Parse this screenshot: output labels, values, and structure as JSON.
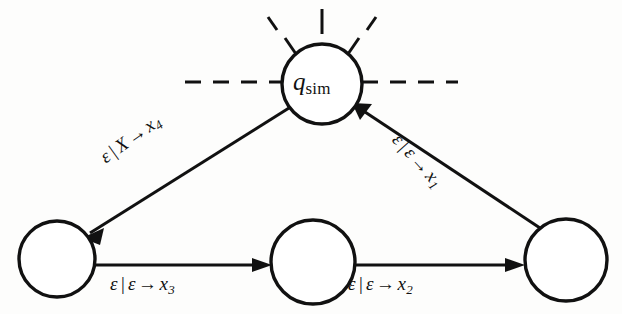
{
  "diagram": {
    "type": "finite-state-transducer",
    "title_text": "",
    "colors": {
      "stroke": "#111111",
      "node_fill": "#ffffff",
      "background": "#fdfdfc"
    },
    "nodes": [
      {
        "id": "q_sim",
        "label_main": "q",
        "label_sub": "sim",
        "cx": 322,
        "cy": 84,
        "r": 40,
        "has_rays": true,
        "has_dashes": true
      },
      {
        "id": "state-bottom-left",
        "label_main": "",
        "label_sub": "",
        "cx": 57,
        "cy": 259,
        "r": 38,
        "has_rays": false,
        "has_dashes": false
      },
      {
        "id": "state-bottom-middle",
        "label_main": "",
        "label_sub": "",
        "cx": 313,
        "cy": 262,
        "r": 42,
        "has_rays": false,
        "has_dashes": false
      },
      {
        "id": "state-bottom-right",
        "label_main": "",
        "label_sub": "",
        "cx": 566,
        "cy": 260,
        "r": 41,
        "has_rays": false,
        "has_dashes": false
      }
    ],
    "edges": [
      {
        "id": "edge-qsim-to-bottom-left",
        "from": "q_sim",
        "to": "state-bottom-left",
        "input": "ε",
        "stack_pop": "X",
        "stack_push": "x",
        "stack_push_sub": "4",
        "label_full": "ε | X → x4"
      },
      {
        "id": "edge-bottom-left-to-bottom-middle",
        "from": "state-bottom-left",
        "to": "state-bottom-middle",
        "input": "ε",
        "stack_pop": "ε",
        "stack_push": "x",
        "stack_push_sub": "3",
        "label_full": "ε | ε → x3"
      },
      {
        "id": "edge-bottom-middle-to-bottom-right",
        "from": "state-bottom-middle",
        "to": "state-bottom-right",
        "input": "ε",
        "stack_pop": "ε",
        "stack_push": "x",
        "stack_push_sub": "2",
        "label_full": "ε | ε → x2"
      },
      {
        "id": "edge-bottom-right-to-qsim",
        "from": "state-bottom-right",
        "to": "q_sim",
        "input": "ε",
        "stack_pop": "ε",
        "stack_push": "x",
        "stack_push_sub": "1",
        "label_full": "ε | ε → x1"
      }
    ],
    "symbols": {
      "epsilon": "ε",
      "separator": "|",
      "arrow": "→",
      "pop_symbol": "X",
      "push_base": "x"
    }
  }
}
